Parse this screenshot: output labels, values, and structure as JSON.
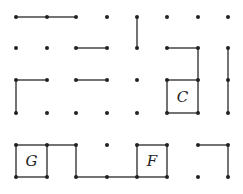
{
  "game": {
    "type": "dots-and-boxes",
    "columns": 8,
    "rows": 6,
    "col_x": [
      16,
      47,
      76,
      107,
      137,
      167,
      198,
      228
    ],
    "row_y": [
      17,
      48,
      80,
      113,
      145,
      177
    ],
    "dot_color": "#222222",
    "line_color": "#444444",
    "horizontal_lines": [
      [
        0,
        0
      ],
      [
        0,
        1
      ],
      [
        1,
        2
      ],
      [
        1,
        5
      ],
      [
        2,
        0
      ],
      [
        2,
        2
      ],
      [
        2,
        5
      ],
      [
        3,
        5
      ],
      [
        4,
        0
      ],
      [
        4,
        1
      ],
      [
        4,
        4
      ],
      [
        4,
        6
      ],
      [
        5,
        0
      ],
      [
        5,
        2
      ],
      [
        5,
        3
      ],
      [
        5,
        4
      ]
    ],
    "vertical_lines": [
      [
        0,
        4
      ],
      [
        1,
        6
      ],
      [
        1,
        7
      ],
      [
        2,
        0
      ],
      [
        2,
        5
      ],
      [
        2,
        6
      ],
      [
        2,
        7
      ],
      [
        4,
        0
      ],
      [
        4,
        1
      ],
      [
        4,
        2
      ],
      [
        4,
        4
      ],
      [
        4,
        5
      ],
      [
        4,
        7
      ]
    ],
    "claimed_boxes": [
      {
        "row": 2,
        "col": 5,
        "label": "C"
      },
      {
        "row": 4,
        "col": 0,
        "label": "G"
      },
      {
        "row": 4,
        "col": 4,
        "label": "F"
      }
    ]
  }
}
